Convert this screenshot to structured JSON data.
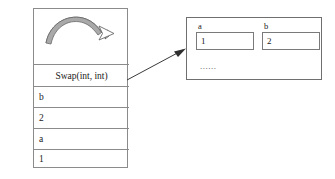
{
  "diagram": {
    "call_stack": {
      "frames": [
        {
          "label": "Swap(int, int)",
          "align": "center"
        },
        {
          "label": "b",
          "align": "left"
        },
        {
          "label": "2",
          "align": "left"
        },
        {
          "label": "a",
          "align": "left"
        },
        {
          "label": "1",
          "align": "left"
        }
      ]
    },
    "swap_arrow": {
      "icon": "curved-swap-arrow-icon",
      "fill_color": "#a8a8a8",
      "stroke_color": "#5a5a5a"
    },
    "connector": {
      "icon": "arrow-right-up-icon",
      "color": "#3a3a3a"
    },
    "memory_box": {
      "variables": [
        {
          "name": "a",
          "value": "1"
        },
        {
          "name": "b",
          "value": "2"
        }
      ],
      "ellipsis": "......",
      "border_color": "#6f6f6f"
    }
  }
}
